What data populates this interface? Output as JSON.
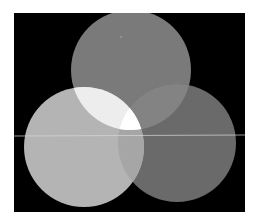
{
  "figure": {
    "background": "#000000",
    "frame_border": "#ffffff",
    "circles": [
      {
        "name": "top",
        "cx": 117,
        "cy": 57,
        "r": 60,
        "fill": "#7a7a7a"
      },
      {
        "name": "left",
        "cx": 70,
        "cy": 134,
        "r": 60,
        "fill": "#b4b4b4"
      },
      {
        "name": "right",
        "cx": 163,
        "cy": 130,
        "r": 59,
        "fill": "#6a6a6a"
      }
    ],
    "overlaps": {
      "top_left": "#f0f0f0",
      "top_right": "#808080",
      "left_right": "#a8a8a8",
      "center": "#ffffff"
    },
    "scanline_y": 123
  }
}
